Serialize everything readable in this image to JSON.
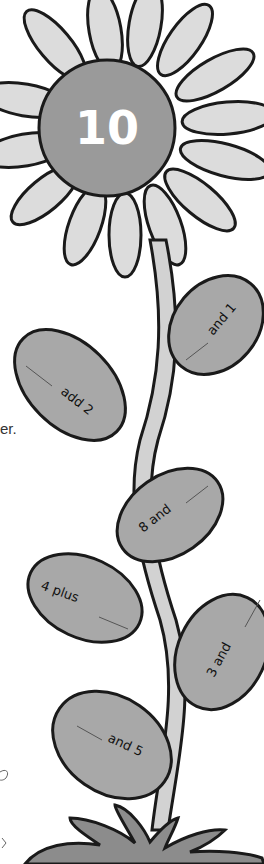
{
  "flower": {
    "center_number": "10",
    "colors": {
      "outline": "#1a1a1a",
      "petal": "#dcdcdc",
      "center": "#9a9a9a",
      "stem": "#d2d2d2",
      "leaf": "#a8a8a8",
      "grass": "#8c8c8c",
      "background": "#ffffff"
    }
  },
  "leaves": [
    {
      "label": "and 1",
      "blank": "____"
    },
    {
      "label": "add 2",
      "blank": "____"
    },
    {
      "label": "8 and",
      "blank": "____"
    },
    {
      "label": "4 plus",
      "blank": "____"
    },
    {
      "label": "3 and",
      "blank": "____"
    },
    {
      "label": "and 5",
      "blank": "____"
    }
  ],
  "edge_text": {
    "partial_word": "er."
  }
}
